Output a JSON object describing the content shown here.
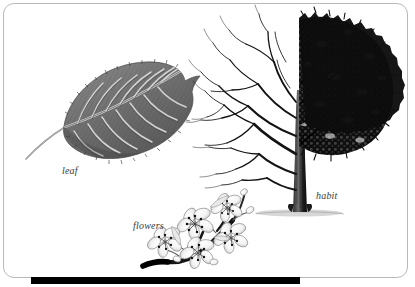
{
  "plate": {
    "kind": "botanical-illustration-plate",
    "background_color": "#ffffff",
    "frame": {
      "border_color": "#b9b9b9",
      "corner_radius_px": 11
    },
    "footer_bar": {
      "color": "#000000",
      "left_px": 31,
      "right_px": 300,
      "top_px": 277,
      "height_px": 7
    }
  },
  "labels": {
    "leaf": "leaf",
    "flowers": "flowers",
    "habit": "habit"
  },
  "specimens": [
    {
      "id": "leaf",
      "label": "leaf",
      "description": "Single ovate leaf with acuminate tip, serrate margin, pinnate venation and slender petiole angled to the lower left",
      "position": "upper-left",
      "ink_tone": "#6a6a6a"
    },
    {
      "id": "flowers",
      "label": "flowers",
      "description": "Cluster of five-petalled blossoms with dark stamens on a dark woody twig",
      "position": "lower-centre",
      "ink_tone": "#111111"
    },
    {
      "id": "habit",
      "label": "habit",
      "description": "Whole tree in split rendering: bare winter branch structure on the left half, dense summer crown on the right half, with ground shadow at the trunk base",
      "position": "right",
      "ink_tone": "#101010"
    }
  ],
  "palette": {
    "paper": "#ffffff",
    "frame_line": "#b9b9b9",
    "ink_dark": "#101010",
    "ink_mid": "#6a6a6a",
    "ink_light": "#b0b0b0",
    "label_text": "#3a3a3a"
  }
}
